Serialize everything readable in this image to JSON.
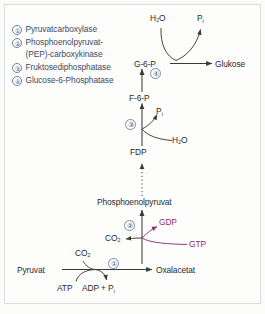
{
  "figure": {
    "background_color": "#fdfdfb",
    "border_color": "#d9dde2",
    "text_color": "#2b2b2b",
    "legend_text_color": "#3b4a66",
    "accent_color": "#8e2f73"
  },
  "legend": {
    "items": [
      {
        "number": "①",
        "label": "Pyruvatcarboxylase",
        "continuation": ""
      },
      {
        "number": "②",
        "label": "Phosphoenolpyruvat-",
        "continuation": "(PEP)-carboxykinase"
      },
      {
        "number": "③",
        "label": "Fruktosediphosphatase",
        "continuation": ""
      },
      {
        "number": "④",
        "label": "Glucose-6-Phosphatase",
        "continuation": ""
      }
    ]
  },
  "metabolites": {
    "glucose": "Glukose",
    "g6p": "G-6-P",
    "f6p": "F-6-P",
    "fdp": "FDP",
    "pep": "Phosphoenolpyruvat",
    "oxaloacetate": "Oxalacetat",
    "pyruvate": "Pyruvat"
  },
  "cofactors": {
    "water_top": "H₂O",
    "pi_top": "P",
    "pi_top_sub": "i",
    "pi_mid": "P",
    "pi_mid_sub": "i",
    "water_mid": "H₂O",
    "gdp": "GDP",
    "gtp": "GTP",
    "co2_pep": "CO₂",
    "co2_pyr": "CO₂",
    "atp": "ATP",
    "adp_pi": "ADP + P",
    "adp_pi_sub": "i"
  },
  "reaction_numbers": {
    "pyruvate_carboxylase": "①",
    "pep_carboxykinase": "②",
    "fdpase": "③",
    "g6pase": "④"
  }
}
